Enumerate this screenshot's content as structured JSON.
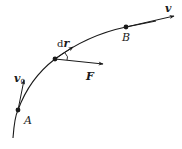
{
  "diagram": {
    "type": "trajectory-work-diagram",
    "colors": {
      "stroke": "#1a1a1a",
      "background": "#ffffff"
    },
    "points": [
      {
        "id": "A",
        "label": "A"
      },
      {
        "id": "B",
        "label": "B"
      }
    ],
    "vectors": {
      "v0": {
        "label": "v",
        "subscript": "0"
      },
      "dr": {
        "prefix": "d",
        "label": "r"
      },
      "F": {
        "label": "F"
      },
      "v": {
        "label": "v"
      }
    }
  }
}
